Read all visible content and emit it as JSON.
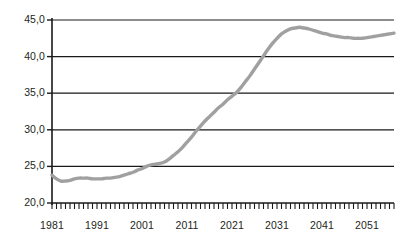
{
  "chart_data": {
    "type": "line",
    "title": "",
    "subtitle": "",
    "xlabel": "",
    "ylabel": "",
    "xlim": [
      1981,
      2057
    ],
    "ylim": [
      20.0,
      45.0
    ],
    "y_ticks": [
      20.0,
      25.0,
      30.0,
      35.0,
      40.0,
      45.0
    ],
    "y_tick_labels": [
      "20,0",
      "25,0",
      "30,0",
      "35,0",
      "40,0",
      "45,0"
    ],
    "x_ticks": [
      1981,
      1991,
      2001,
      2011,
      2021,
      2031,
      2041,
      2051
    ],
    "x_tick_labels": [
      "1981",
      "1991",
      "2001",
      "2011",
      "2021",
      "2031",
      "2041",
      "2051"
    ],
    "x_minor_tick_step": 1,
    "grid": "horizontal",
    "legend": "none",
    "line_color": "#a0a0a0",
    "axis_color": "#1a1a1a",
    "series": [
      {
        "name": "series-1",
        "x": [
          1981,
          1982,
          1983,
          1984,
          1985,
          1986,
          1987,
          1988,
          1989,
          1990,
          1991,
          1992,
          1993,
          1994,
          1995,
          1996,
          1997,
          1998,
          1999,
          2000,
          2001,
          2002,
          2003,
          2004,
          2005,
          2006,
          2007,
          2008,
          2009,
          2010,
          2011,
          2012,
          2013,
          2014,
          2015,
          2016,
          2017,
          2018,
          2019,
          2020,
          2021,
          2022,
          2023,
          2024,
          2025,
          2026,
          2027,
          2028,
          2029,
          2030,
          2031,
          2032,
          2033,
          2034,
          2035,
          2036,
          2037,
          2038,
          2039,
          2040,
          2041,
          2042,
          2043,
          2044,
          2045,
          2046,
          2047,
          2048,
          2049,
          2050,
          2051,
          2052,
          2053,
          2054,
          2055,
          2056,
          2057
        ],
        "values": [
          23.8,
          23.3,
          23.0,
          23.0,
          23.1,
          23.3,
          23.4,
          23.4,
          23.4,
          23.3,
          23.3,
          23.3,
          23.4,
          23.4,
          23.5,
          23.6,
          23.8,
          24.0,
          24.2,
          24.5,
          24.7,
          25.0,
          25.2,
          25.3,
          25.4,
          25.6,
          26.0,
          26.5,
          27.0,
          27.6,
          28.3,
          29.0,
          29.8,
          30.5,
          31.2,
          31.8,
          32.4,
          33.0,
          33.5,
          34.1,
          34.6,
          35.1,
          35.8,
          36.6,
          37.4,
          38.3,
          39.2,
          40.1,
          41.0,
          41.8,
          42.5,
          43.1,
          43.5,
          43.8,
          43.9,
          44.0,
          43.9,
          43.8,
          43.6,
          43.4,
          43.2,
          43.1,
          42.9,
          42.8,
          42.7,
          42.6,
          42.6,
          42.5,
          42.5,
          42.5,
          42.6,
          42.7,
          42.8,
          42.9,
          43.0,
          43.1,
          43.2
        ]
      }
    ]
  }
}
